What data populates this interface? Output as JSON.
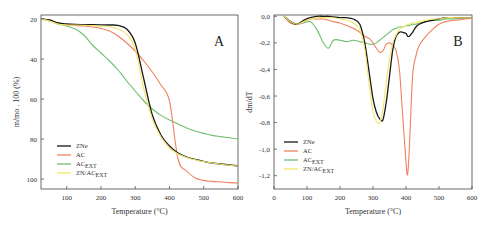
{
  "chart_data": [
    {
      "type": "line",
      "panel_label": "A",
      "title": "",
      "xlabel": "Temperature (°C)",
      "ylabel": "m/mo . 100 (%)",
      "xlim": [
        25,
        600
      ],
      "ylim": [
        15,
        102
      ],
      "xticks": [
        100,
        200,
        300,
        400,
        500,
        600
      ],
      "yticks": [
        20,
        40,
        60,
        80,
        100
      ],
      "grid": false,
      "legend_position": "lower left",
      "x": [
        25,
        50,
        75,
        100,
        125,
        150,
        175,
        200,
        225,
        250,
        275,
        300,
        325,
        350,
        375,
        400,
        425,
        450,
        475,
        500,
        525,
        550,
        575,
        600
      ],
      "series": [
        {
          "name": "ZNe",
          "color": "#1a1a1a",
          "values": [
            100,
            99.5,
            98,
            97.5,
            97.3,
            97.2,
            97.2,
            97.1,
            97,
            96.8,
            95,
            88,
            70,
            52,
            42,
            36.5,
            33,
            31,
            29.8,
            28.8,
            28,
            27.5,
            27,
            26.5
          ]
        },
        {
          "name": "AC",
          "color": "#f08060",
          "values": [
            100,
            99.5,
            98,
            97,
            96.8,
            96.5,
            96,
            95.3,
            94,
            91.5,
            88,
            84,
            79,
            73.5,
            67,
            59,
            30,
            24,
            20.5,
            19.3,
            18.8,
            18.5,
            18.2,
            18
          ]
        },
        {
          "name": "ACEXT",
          "color": "#6fbf6f",
          "values": [
            100,
            99,
            97.5,
            96.5,
            95,
            92,
            87,
            83,
            79,
            74.5,
            69,
            64,
            59,
            55,
            51.8,
            49.5,
            47.5,
            45.5,
            44,
            42.8,
            41.8,
            41.2,
            40.6,
            40
          ]
        },
        {
          "name": "ZN/ACEXT",
          "color": "#f5e66a",
          "values": [
            100,
            99,
            97.5,
            97,
            97,
            96.9,
            96.7,
            96.4,
            96,
            95,
            92.5,
            85,
            65,
            50,
            41,
            35.5,
            32.5,
            30.8,
            29.6,
            28.7,
            28,
            27.4,
            26.9,
            26.5
          ]
        }
      ]
    },
    {
      "type": "line",
      "panel_label": "B",
      "title": "",
      "xlabel": "Temperature (°C)",
      "ylabel": "dm/dT",
      "xlim": [
        0,
        600
      ],
      "ylim": [
        -1.3,
        0.01
      ],
      "xticks": [
        0,
        100,
        200,
        300,
        400,
        500,
        600
      ],
      "yticks": [
        "0,0",
        "-0,2",
        "-0,4",
        "-0,6",
        "-0,8",
        "-1,0",
        "-1,2"
      ],
      "grid": false,
      "legend_position": "lower left",
      "x": [
        30,
        50,
        70,
        90,
        110,
        130,
        150,
        165,
        180,
        200,
        220,
        240,
        260,
        275,
        290,
        300,
        310,
        320,
        330,
        340,
        350,
        360,
        370,
        380,
        390,
        400,
        405,
        410,
        420,
        430,
        440,
        460,
        480,
        500,
        520,
        550,
        580,
        600
      ],
      "series": [
        {
          "name": "ZNe",
          "color": "#1a1a1a",
          "values": [
            0,
            -0.04,
            -0.06,
            -0.03,
            -0.01,
            0,
            0,
            0,
            -0.005,
            -0.01,
            -0.01,
            -0.02,
            -0.06,
            -0.2,
            -0.45,
            -0.62,
            -0.72,
            -0.77,
            -0.78,
            -0.65,
            -0.45,
            -0.25,
            -0.15,
            -0.12,
            -0.12,
            -0.13,
            -0.15,
            -0.15,
            -0.12,
            -0.08,
            -0.06,
            -0.04,
            -0.03,
            -0.02,
            -0.01,
            -0.01,
            -0.01,
            -0.01
          ]
        },
        {
          "name": "AC",
          "color": "#f08060",
          "values": [
            0,
            -0.05,
            -0.06,
            -0.04,
            -0.02,
            -0.02,
            -0.02,
            -0.03,
            -0.04,
            -0.05,
            -0.07,
            -0.09,
            -0.12,
            -0.15,
            -0.17,
            -0.2,
            -0.24,
            -0.27,
            -0.26,
            -0.21,
            -0.2,
            -0.22,
            -0.26,
            -0.4,
            -0.75,
            -1.1,
            -1.19,
            -1.0,
            -0.45,
            -0.3,
            -0.22,
            -0.15,
            -0.1,
            -0.06,
            -0.04,
            -0.03,
            -0.02,
            -0.01
          ]
        },
        {
          "name": "ACEXT",
          "color": "#6fbf6f",
          "values": [
            0,
            -0.04,
            -0.06,
            -0.05,
            -0.04,
            -0.1,
            -0.2,
            -0.24,
            -0.18,
            -0.18,
            -0.19,
            -0.18,
            -0.19,
            -0.2,
            -0.21,
            -0.21,
            -0.2,
            -0.18,
            -0.16,
            -0.14,
            -0.12,
            -0.1,
            -0.09,
            -0.08,
            -0.08,
            -0.07,
            -0.07,
            -0.07,
            -0.06,
            -0.06,
            -0.05,
            -0.04,
            -0.03,
            -0.03,
            -0.02,
            -0.02,
            -0.01,
            -0.01
          ]
        },
        {
          "name": "ZN/ACEXT",
          "color": "#f5e66a",
          "values": [
            0,
            -0.04,
            -0.06,
            -0.04,
            -0.02,
            -0.01,
            -0.01,
            -0.01,
            -0.01,
            -0.02,
            -0.03,
            -0.05,
            -0.1,
            -0.25,
            -0.55,
            -0.72,
            -0.79,
            -0.8,
            -0.7,
            -0.5,
            -0.32,
            -0.2,
            -0.14,
            -0.1,
            -0.08,
            -0.07,
            -0.06,
            -0.06,
            -0.05,
            -0.05,
            -0.04,
            -0.03,
            -0.02,
            -0.02,
            -0.01,
            -0.01,
            -0.01,
            -0.01
          ]
        }
      ]
    }
  ],
  "panels": {
    "A": {
      "label": "A",
      "ylabel": "m/mo . 100 (%)",
      "xlabel": "Temperature (°C)",
      "xtick_labels": [
        "100",
        "200",
        "300",
        "400",
        "500",
        "600"
      ],
      "ytick_labels": [
        "100",
        "80",
        "60",
        "40",
        "20"
      ]
    },
    "B": {
      "label": "B",
      "ylabel": "dm/dT",
      "xlabel": "Temperature (°C)",
      "xtick_labels": [
        "0",
        "100",
        "200",
        "300",
        "400",
        "500",
        "600"
      ],
      "ytick_labels": [
        "0,0",
        "-0,2",
        "-0,4",
        "-0,6",
        "-0,8",
        "-1,0",
        "-1,2"
      ]
    }
  },
  "legend": [
    {
      "main": "ZNe",
      "sub": ""
    },
    {
      "main": "AC",
      "sub": ""
    },
    {
      "main": "AC",
      "sub": "EXT"
    },
    {
      "main": "ZN/AC",
      "sub": "EXT"
    }
  ]
}
